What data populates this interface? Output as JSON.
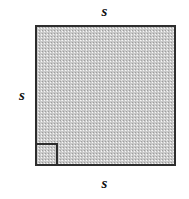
{
  "figure": {
    "name": "labeled-square-with-right-angle-mark",
    "shape": "square",
    "fill_color": "#c9c9c9",
    "stroke_color": "#2e2e2e",
    "background_color": "#ffffff",
    "labels": {
      "top": "s",
      "left": "s",
      "bottom": "s"
    },
    "right_angle_marker": {
      "present": true,
      "position": "bottom-left",
      "size_px": 23
    }
  }
}
